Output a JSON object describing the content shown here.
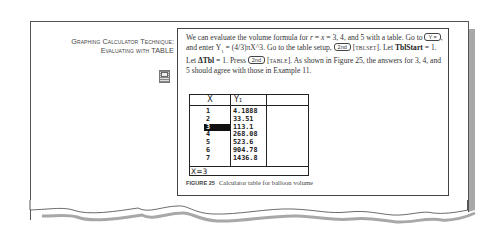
{
  "sidebar": {
    "title_line1": "Graphing Calculator Technique:",
    "title_line2": "Evaluating with TABLE",
    "icon": "calculator-icon"
  },
  "content": {
    "para": {
      "t1": "We can evaluate the volume formula for ",
      "var_r": "r",
      "t2": " = ",
      "var_x": "x",
      "t3": " = 3, 4, and 5 with a table. Go to ",
      "key_y": "Y =",
      "t4": ", and enter Y",
      "sub1": "1",
      "t5": " = (4/3)πX^3. Go to the table setup, ",
      "key_2nd_a": "2nd",
      "t6": " [",
      "tblset": "TBLSET",
      "t7": "]. Let ",
      "tblstart": "TblStart",
      "t8": " = 1. Let ",
      "dtbl": "ΔTbl",
      "t9": " = 1. Press ",
      "key_2nd_b": "2nd",
      "t10": " [",
      "table": "TABLE",
      "t11": "]. As shown in Figure 25, the answers for 3, 4, and 5 should agree with those in Example 11."
    },
    "calculator": {
      "header_x": "X",
      "header_y": "Y₁",
      "rows": [
        {
          "x": "1",
          "y": "4.1888"
        },
        {
          "x": "2",
          "y": "33.51"
        },
        {
          "x": "3",
          "y": "113.1"
        },
        {
          "x": "4",
          "y": "268.08"
        },
        {
          "x": "5",
          "y": "523.6"
        },
        {
          "x": "6",
          "y": "904.78"
        },
        {
          "x": "7",
          "y": "1436.8"
        }
      ],
      "selected_row": 3,
      "footer": "X=3"
    },
    "caption": {
      "label": "FIGURE 25",
      "text": "Calculator table for balloon volume"
    }
  }
}
